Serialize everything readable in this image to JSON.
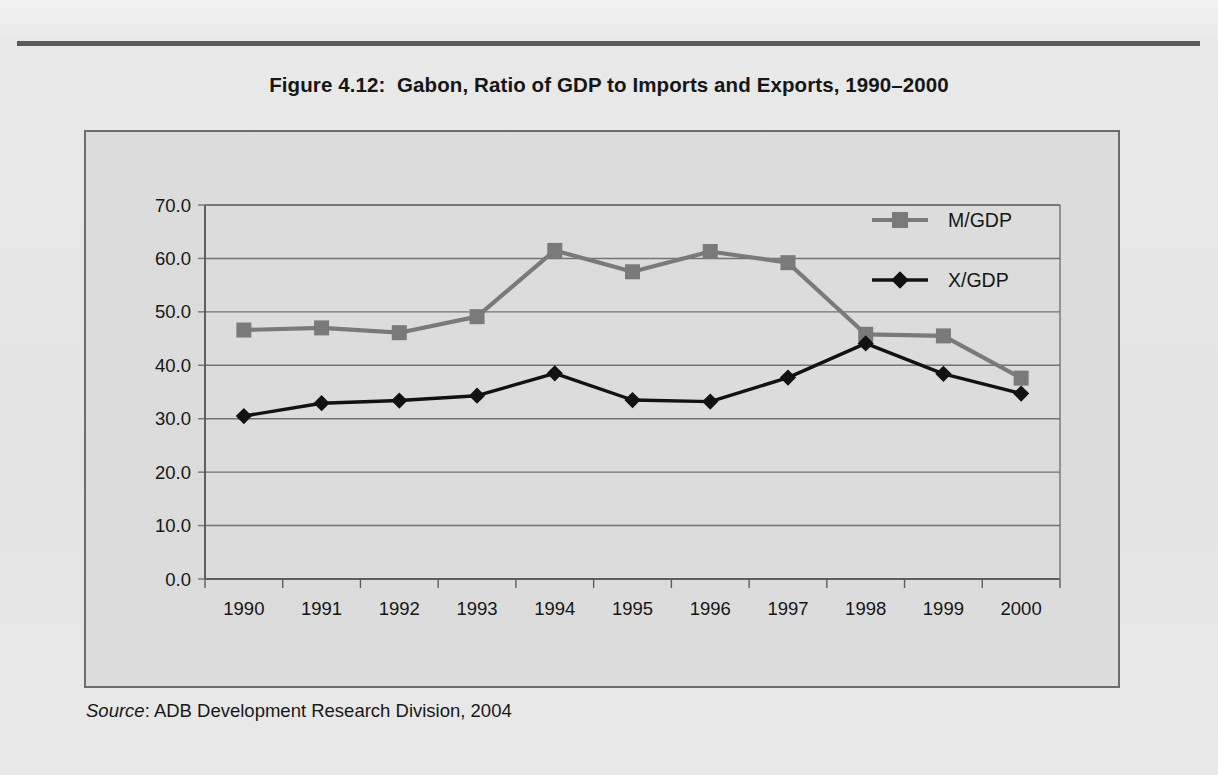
{
  "figure": {
    "title": "Figure 4.12:  Gabon, Ratio of GDP to Imports and Exports, 1990–2000",
    "source_label": "Source",
    "source_sep": ": ",
    "source_text": "ADB Development Research Division, 2004"
  },
  "colors": {
    "page_background": "#e8e8e8",
    "panel_background": "#dcdcdc",
    "panel_border": "#6d6d6d",
    "rule": "#5a5a5a",
    "gridline": "#737373",
    "axis": "#5f5f5f",
    "series_m_gdp": "#7a7a7a",
    "series_x_gdp": "#121212",
    "text": "#161616"
  },
  "chart_data": {
    "type": "line",
    "title": "Figure 4.12:  Gabon, Ratio of GDP to Imports and Exports, 1990–2000",
    "xlabel": "",
    "ylabel": "",
    "x": [
      1990,
      1991,
      1992,
      1993,
      1994,
      1995,
      1996,
      1997,
      1998,
      1999,
      2000
    ],
    "categories": [
      "1990",
      "1991",
      "1992",
      "1993",
      "1994",
      "1995",
      "1996",
      "1997",
      "1998",
      "1999",
      "2000"
    ],
    "series": [
      {
        "name": "M/GDP",
        "color": "#7a7a7a",
        "marker": "square",
        "values": [
          46.6,
          47.0,
          46.1,
          49.1,
          61.5,
          57.5,
          61.3,
          59.2,
          45.8,
          45.5,
          37.6
        ]
      },
      {
        "name": "X/GDP",
        "color": "#121212",
        "marker": "diamond",
        "values": [
          30.5,
          32.9,
          33.4,
          34.3,
          38.5,
          33.5,
          33.2,
          37.7,
          44.1,
          38.4,
          34.7
        ]
      }
    ],
    "ylim": [
      0.0,
      70.0
    ],
    "yticks": [
      0.0,
      10.0,
      20.0,
      30.0,
      40.0,
      50.0,
      60.0,
      70.0
    ],
    "ytick_labels": [
      "0.0",
      "10.0",
      "20.0",
      "30.0",
      "40.0",
      "50.0",
      "60.0",
      "70.0"
    ],
    "grid": true,
    "grid_axis": "y",
    "legend_position": "upper right",
    "legend_entries": [
      "M/GDP",
      "X/GDP"
    ]
  }
}
